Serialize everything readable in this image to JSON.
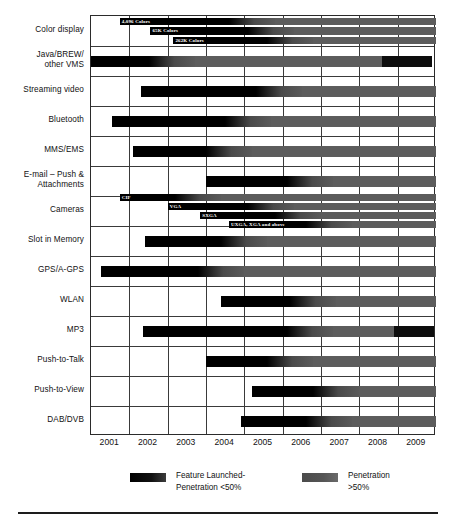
{
  "chart_data": {
    "type": "bar",
    "title": "",
    "subtitle": "",
    "xlabel": "",
    "ylabel": "",
    "orientation": "horizontal",
    "grid": true,
    "xlim": [
      2001,
      2010
    ],
    "x_ticks": [
      "2001",
      "2002",
      "2003",
      "2004",
      "2005",
      "2006",
      "2007",
      "2008",
      "2009"
    ],
    "categories": [
      "Color display",
      "Java/BREW/ other VMS",
      "Streaming video",
      "Bluetooth",
      "MMS/EMS",
      "E-mail – Push & Attachments",
      "Cameras",
      "Slot in Memory",
      "GPS/A-GPS",
      "WLAN",
      "MP3",
      "Push-to-Talk",
      "Push-to-View",
      "DAB/DVB"
    ],
    "legend": {
      "position": "bottom",
      "entries": [
        {
          "label": "Feature Launched-Penetration <50%",
          "color": "#000000"
        },
        {
          "label": "Penetration >50%",
          "color": "#5c5c5c"
        }
      ]
    },
    "bars": [
      {
        "category": "Color display",
        "sub_label": "4,096 Colors",
        "launch_year": 2001.75,
        "penetration_year": 2004.6,
        "end_year": 2010.0
      },
      {
        "category": "Color display",
        "sub_label": "65K Colors",
        "launch_year": 2002.55,
        "penetration_year": 2005.1,
        "end_year": 2010.0
      },
      {
        "category": "Color display",
        "sub_label": "262K Colors",
        "launch_year": 2003.15,
        "penetration_year": 2005.6,
        "end_year": 2010.0
      },
      {
        "category": "Java/BREW/ other VMS",
        "sub_label": "",
        "launch_year": 2001.0,
        "penetration_year": 2002.5,
        "end_year": 2009.9
      },
      {
        "category": "Streaming video",
        "sub_label": "",
        "launch_year": 2002.3,
        "penetration_year": 2005.3,
        "end_year": 2010.0
      },
      {
        "category": "Bluetooth",
        "sub_label": "",
        "launch_year": 2001.55,
        "penetration_year": 2004.5,
        "end_year": 2010.0
      },
      {
        "category": "MMS/EMS",
        "sub_label": "",
        "launch_year": 2002.1,
        "penetration_year": 2004.0,
        "end_year": 2010.0
      },
      {
        "category": "E-mail – Push & Attachments",
        "sub_label": "",
        "launch_year": 2004.0,
        "penetration_year": 2006.1,
        "end_year": 2010.0
      },
      {
        "category": "Cameras",
        "sub_label": "CIF",
        "launch_year": 2001.75,
        "penetration_year": 2003.2,
        "end_year": 2010.0
      },
      {
        "category": "Cameras",
        "sub_label": "VGA",
        "launch_year": 2003.0,
        "penetration_year": 2005.1,
        "end_year": 2010.0
      },
      {
        "category": "Cameras",
        "sub_label": "SXGA",
        "launch_year": 2003.85,
        "penetration_year": 2005.8,
        "end_year": 2010.0
      },
      {
        "category": "Cameras",
        "sub_label": "UXGA, XGA and above",
        "launch_year": 2004.6,
        "penetration_year": 2006.6,
        "end_year": 2010.0
      },
      {
        "category": "Slot in Memory",
        "sub_label": "",
        "launch_year": 2002.4,
        "penetration_year": 2004.4,
        "end_year": 2010.0
      },
      {
        "category": "GPS/A-GPS",
        "sub_label": "",
        "launch_year": 2001.25,
        "penetration_year": 2003.8,
        "end_year": 2010.0
      },
      {
        "category": "WLAN",
        "sub_label": "",
        "launch_year": 2004.4,
        "penetration_year": 2006.2,
        "end_year": 2010.0
      },
      {
        "category": "MP3",
        "sub_label": "",
        "launch_year": 2002.35,
        "penetration_year": 2006.1,
        "end_year": 2009.95
      },
      {
        "category": "Push-to-Talk",
        "sub_label": "",
        "launch_year": 2004.0,
        "penetration_year": 2005.6,
        "end_year": 2010.0
      },
      {
        "category": "Push-to-View",
        "sub_label": "",
        "launch_year": 2005.2,
        "penetration_year": 2006.8,
        "end_year": 2010.0
      },
      {
        "category": "DAB/DVB",
        "sub_label": "",
        "launch_year": 2004.9,
        "penetration_year": 2006.6,
        "end_year": 2010.0
      }
    ]
  },
  "colors": {
    "launched": "#000000",
    "penetration": "#5c5c5c",
    "grid": "#3a3a3a",
    "frame": "#2b2b2b",
    "text": "#111111"
  }
}
